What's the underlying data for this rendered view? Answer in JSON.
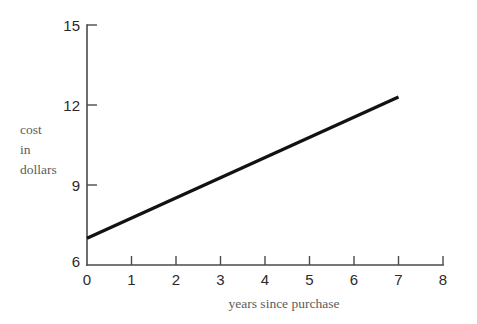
{
  "chart_data": {
    "type": "line",
    "title": "",
    "xlabel": "years since purchase",
    "ylabel": "cost in dollars",
    "ylabel_lines": [
      "cost",
      "in",
      "dollars"
    ],
    "xlim": [
      0,
      8
    ],
    "ylim": [
      6,
      15
    ],
    "xticks": [
      0,
      1,
      2,
      3,
      4,
      5,
      6,
      7,
      8
    ],
    "xtick_labels": [
      "0",
      "1",
      "2",
      "3",
      "4",
      "5",
      "6",
      "7",
      "8"
    ],
    "yticks": [
      6,
      9,
      12,
      15
    ],
    "ytick_labels": [
      "6",
      "9",
      "12",
      "15"
    ],
    "grid": false,
    "legend": null,
    "series": [
      {
        "name": "cost",
        "x": [
          0,
          7
        ],
        "values": [
          7.0,
          12.3
        ],
        "color": "#121212",
        "slope_per_year": 0.757,
        "intercept": 7.0
      }
    ],
    "annotations": []
  },
  "colors": {
    "background": "#ffffff",
    "axis": "#4a4a4a",
    "tick_text": "#2b2b2b",
    "axis_title": "#5b5b5b",
    "series": "#121212"
  }
}
